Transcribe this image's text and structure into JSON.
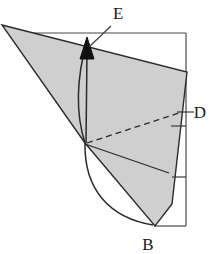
{
  "figure": {
    "background_color": "#ffffff",
    "shade_fill": "#cfcfcf",
    "stroke_color": "#2b2b2b",
    "frame_color": "#3a3a3a",
    "labels": {
      "E": "E",
      "D": "D",
      "B": "B"
    },
    "geometry": {
      "shaded_polygon_points": "2,25 187,72 172,204 155,226 85,143",
      "frame_top_line": "18,33 186,33",
      "frame_right_line": "186,33 186,226",
      "frame_bottom_line": "186,226 155,226",
      "leader_line_E": "112,25 88,48",
      "arrow_shaft": "87,50 87,143",
      "arrow_head": "87,38 80,58 94,58",
      "dashed_line_D": "87,143 182,112",
      "solid_ray": "85,144 168,172",
      "curve_upper": "87,40 78,95 85,143",
      "curve_lower": "85,143 88,205 152,224",
      "tick_D": "176,112 194,112",
      "tick_mid": "170,125 186,125",
      "tick_lower": "172,177 186,177"
    },
    "label_positions": {
      "E": {
        "x": 113,
        "y": 19
      },
      "D": {
        "x": 200,
        "y": 118
      },
      "B": {
        "x": 148,
        "y": 249
      }
    }
  }
}
